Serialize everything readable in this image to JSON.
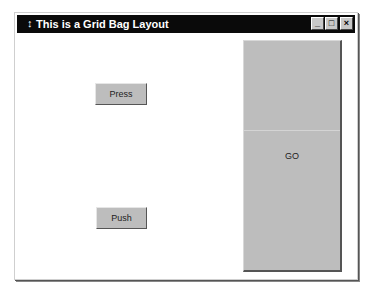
{
  "window": {
    "title": "This is a Grid Bag Layout",
    "title_icon": "↕",
    "controls": {
      "minimize": "_",
      "maximize": "□",
      "close": "×"
    }
  },
  "buttons": {
    "press": "Press",
    "push": "Push",
    "go": "GO"
  },
  "colors": {
    "titlebar": "#0a0a0a",
    "button_face": "#bdbdbd",
    "window_bg": "#ffffff"
  }
}
